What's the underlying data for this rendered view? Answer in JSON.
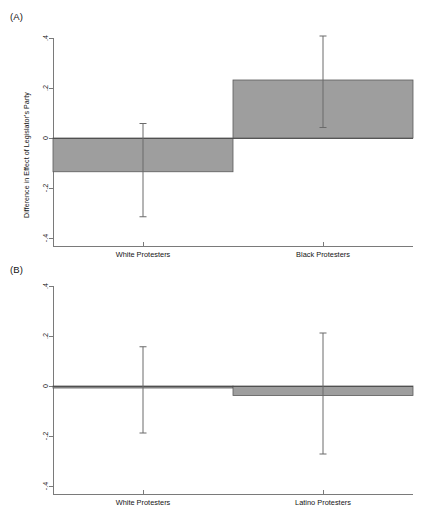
{
  "figure": {
    "background": "#ffffff",
    "bar_fill": "#9e9e9e",
    "bar_stroke": "#5a5a5a",
    "error_color": "#6a6a6a",
    "axis_color": "#7a7a7a"
  },
  "panels": [
    {
      "tag": "(A)",
      "ylabel": "Difference in Effect of Legislator's Party",
      "ytick_labels": [
        ".4",
        ".2",
        "0",
        "-.2",
        "-.4"
      ],
      "ytick_values": [
        0.4,
        0.2,
        0,
        -0.2,
        -0.4
      ],
      "categories": [
        "White Protesters",
        "Black Protesters"
      ]
    },
    {
      "tag": "(B)",
      "ylabel": "Difference in Effect of Legislator's Party",
      "ytick_labels": [
        ".4",
        ".2",
        "0",
        "-.2",
        "-.4"
      ],
      "ytick_values": [
        0.4,
        0.2,
        0,
        -0.2,
        -0.4
      ],
      "categories": [
        "White Protesters",
        "Latino Protesters"
      ]
    }
  ],
  "chart_data": [
    {
      "type": "bar",
      "title": "(A)",
      "categories": [
        "White Protesters",
        "Black Protesters"
      ],
      "values": [
        -0.135,
        0.232
      ],
      "errors_low": [
        -0.315,
        0.042
      ],
      "errors_high": [
        0.058,
        0.408
      ],
      "xlabel": "",
      "ylabel": "Difference in Effect of Legislator's Party",
      "ylim": [
        -0.4,
        0.4
      ],
      "yticks": [
        -0.4,
        -0.2,
        0,
        0.2,
        0.4
      ],
      "ytick_labels": [
        "-.4",
        "-.2",
        "0",
        ".2",
        ".4"
      ],
      "grid": false,
      "legend": "none"
    },
    {
      "type": "bar",
      "title": "(B)",
      "categories": [
        "White Protesters",
        "Latino Protesters"
      ],
      "values": [
        -0.008,
        -0.038
      ],
      "errors_low": [
        -0.188,
        -0.272
      ],
      "errors_high": [
        0.157,
        0.212
      ],
      "xlabel": "",
      "ylabel": "Difference in Effect of Legislator's Party",
      "ylim": [
        -0.4,
        0.4
      ],
      "yticks": [
        -0.4,
        -0.2,
        0,
        0.2,
        0.4
      ],
      "ytick_labels": [
        "-.4",
        "-.2",
        "0",
        ".2",
        ".4"
      ],
      "grid": false,
      "legend": "none"
    }
  ]
}
